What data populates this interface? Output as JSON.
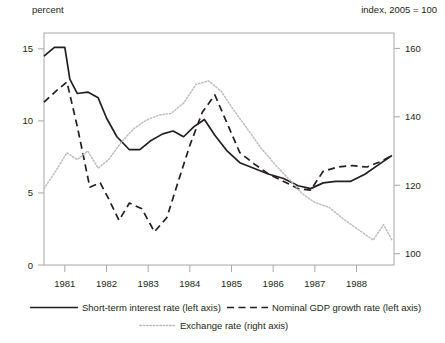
{
  "labels": {
    "left_axis_unit": "percent",
    "right_axis_unit": "index, 2005 = 100"
  },
  "legend": {
    "items": [
      {
        "name": "short-term-interest-rate",
        "label": "Short-term interest  rate (left axis)",
        "style": "solid",
        "color": "#231f20"
      },
      {
        "name": "nominal-gdp-growth-rate",
        "label": "Nominal GDP growth rate  (left axis)",
        "style": "dashed",
        "color": "#231f20"
      },
      {
        "name": "exchange-rate",
        "label": "Exchange rate (right axis)",
        "style": "dotted",
        "color": "#b9b9b9"
      }
    ]
  },
  "chart_data": {
    "type": "line",
    "title": "",
    "xlabel": "",
    "ylabel": "percent",
    "y2label": "index, 2005 = 100",
    "grid": false,
    "legend_position": "bottom",
    "xlim": [
      1980.5,
      1988.9
    ],
    "ylim": [
      0,
      16.1
    ],
    "y2lim": [
      96.7,
      164.5
    ],
    "yticks": [
      0,
      5,
      10,
      15
    ],
    "y2ticks": [
      100,
      120,
      140,
      160
    ],
    "xticks": [
      1981,
      1982,
      1983,
      1984,
      1985,
      1986,
      1987,
      1988
    ],
    "xticklabels": [
      "1981",
      "1982",
      "1983",
      "1984",
      "1985",
      "1986",
      "1987",
      "1988"
    ],
    "series": [
      {
        "name": "Short-term interest rate (left axis)",
        "axis": "left",
        "style": "solid",
        "color": "#231f20",
        "x": [
          1980.5,
          1980.75,
          1981.0,
          1981.12,
          1981.3,
          1981.55,
          1981.8,
          1982.0,
          1982.25,
          1982.55,
          1982.8,
          1983.05,
          1983.35,
          1983.6,
          1983.85,
          1984.1,
          1984.35,
          1984.6,
          1984.9,
          1985.2,
          1985.55,
          1985.9,
          1986.25,
          1986.6,
          1986.9,
          1987.2,
          1987.5,
          1987.85,
          1988.2,
          1988.55,
          1988.85
        ],
        "y": [
          14.5,
          15.1,
          15.1,
          12.9,
          11.9,
          12.0,
          11.6,
          10.2,
          8.9,
          8.0,
          8.0,
          8.6,
          9.1,
          9.3,
          8.9,
          9.6,
          10.1,
          9.0,
          7.9,
          7.1,
          6.7,
          6.3,
          6.0,
          5.5,
          5.3,
          5.7,
          5.8,
          5.8,
          6.3,
          7.0,
          7.6
        ]
      },
      {
        "name": "Nominal GDP growth rate (left axis)",
        "axis": "left",
        "style": "dashed",
        "color": "#231f20",
        "x": [
          1980.5,
          1980.8,
          1981.05,
          1981.3,
          1981.6,
          1981.85,
          1982.05,
          1982.3,
          1982.55,
          1982.85,
          1983.15,
          1983.45,
          1983.7,
          1984.0,
          1984.3,
          1984.6,
          1984.9,
          1985.2,
          1985.55,
          1985.9,
          1986.25,
          1986.6,
          1986.9,
          1987.2,
          1987.55,
          1987.9,
          1988.25,
          1988.6,
          1988.85
        ],
        "y": [
          11.3,
          12.1,
          12.7,
          9.6,
          5.4,
          5.7,
          4.6,
          3.1,
          4.3,
          3.9,
          2.3,
          3.3,
          5.6,
          8.3,
          10.6,
          11.8,
          9.8,
          7.8,
          7.0,
          6.3,
          5.8,
          5.3,
          5.2,
          6.5,
          6.8,
          6.9,
          6.8,
          7.2,
          7.6
        ]
      },
      {
        "name": "Exchange rate (right axis)",
        "axis": "right",
        "style": "dotted",
        "color": "#bdbdbd",
        "x": [
          1980.5,
          1980.8,
          1981.05,
          1981.3,
          1981.55,
          1981.8,
          1982.05,
          1982.35,
          1982.65,
          1982.95,
          1983.25,
          1983.55,
          1983.85,
          1984.15,
          1984.45,
          1984.75,
          1985.05,
          1985.35,
          1985.7,
          1986.05,
          1986.4,
          1986.7,
          1987.0,
          1987.35,
          1987.7,
          1988.05,
          1988.4,
          1988.65,
          1988.85
        ],
        "y": [
          119.0,
          124.5,
          129.5,
          127.5,
          130.0,
          125.0,
          127.5,
          132.5,
          136.5,
          139.0,
          140.5,
          141.0,
          144.0,
          149.5,
          150.5,
          147.5,
          142.0,
          137.0,
          131.0,
          126.0,
          121.5,
          117.5,
          115.0,
          113.5,
          110.0,
          107.0,
          104.0,
          108.5,
          104.0
        ]
      }
    ]
  }
}
